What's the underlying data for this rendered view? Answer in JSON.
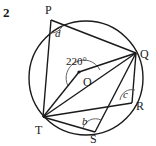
{
  "question_number": "2",
  "points": {
    "P": "P",
    "Q": "Q",
    "R": "R",
    "S": "S",
    "T": "T",
    "O": "O"
  },
  "angles": {
    "reflex_center": "220°",
    "d": "d",
    "c": "c",
    "b": "b"
  },
  "colors": {
    "stroke": "#1a1a1a",
    "arc": "#555555"
  }
}
